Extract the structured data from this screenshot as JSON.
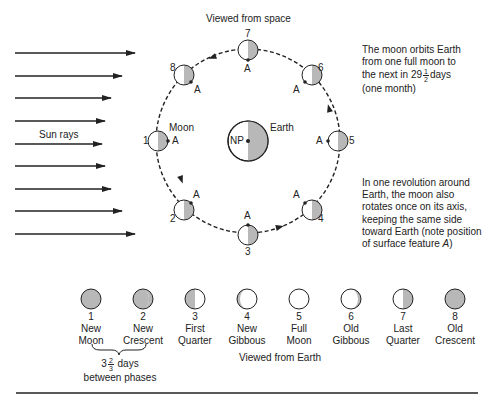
{
  "title": "Viewed from space",
  "sun_rays_label": "Sun rays",
  "moon_label": "Moon",
  "earth_label": "Earth",
  "earth_pole_label": "NP",
  "surface_feature_label": "A",
  "orbit_positions": [
    "1",
    "2",
    "3",
    "4",
    "5",
    "6",
    "7",
    "8"
  ],
  "notes": {
    "orbit_period": {
      "line1": "The moon orbits Earth",
      "line2": "from one full moon to",
      "line3_pre": "the next in 29",
      "frac_num": "1",
      "frac_den": "2",
      "line3_post": "days",
      "line4": "(one month)"
    },
    "rotation": {
      "line1": "In one revolution around",
      "line2": "Earth, the moon also",
      "line3": "rotates once on its axis,",
      "line4": "keeping the same side",
      "line5": "toward Earth (note position",
      "line6_pre": "of surface feature ",
      "line6_em": "A",
      "line6_post": ")"
    }
  },
  "phases_caption": "Viewed from Earth",
  "phases": [
    {
      "num": "1",
      "line1": "New",
      "line2": "Moon"
    },
    {
      "num": "2",
      "line1": "New",
      "line2": "Crescent"
    },
    {
      "num": "3",
      "line1": "First",
      "line2": "Quarter"
    },
    {
      "num": "4",
      "line1": "New",
      "line2": "Gibbous"
    },
    {
      "num": "5",
      "line1": "Full",
      "line2": "Moon"
    },
    {
      "num": "6",
      "line1": "Old",
      "line2": "Gibbous"
    },
    {
      "num": "7",
      "line1": "Last",
      "line2": "Quarter"
    },
    {
      "num": "8",
      "line1": "Old",
      "line2": "Crescent"
    }
  ],
  "interval": {
    "whole": "3",
    "frac_num": "2",
    "frac_den": "3",
    "unit": "days",
    "line2": "between phases"
  },
  "colors": {
    "shade": "#b8b8b8",
    "line": "#222222",
    "background": "#ffffff"
  }
}
